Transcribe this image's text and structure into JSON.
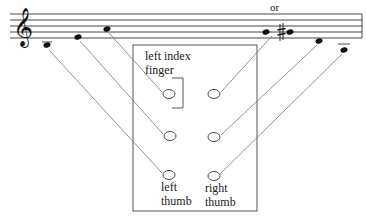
{
  "diagram": {
    "type": "fingering-diagram",
    "staff": {
      "clef": "treble-clef",
      "alt_label": "or",
      "notes": [
        {
          "id": "n1",
          "label": "low note below staff"
        },
        {
          "id": "n2",
          "label": "note below staff"
        },
        {
          "id": "n3",
          "label": "note on staff"
        },
        {
          "id": "n4",
          "label": "note (natural)"
        },
        {
          "id": "n5",
          "label": "note (sharp)"
        },
        {
          "id": "n6",
          "label": "note below staff"
        },
        {
          "id": "n7",
          "label": "note with ledger line"
        }
      ]
    },
    "hands": {
      "left_index_label_line1": "left index",
      "left_index_label_line2": "finger",
      "left_thumb_line1": "left",
      "left_thumb_line2": "thumb",
      "right_thumb_line1": "right",
      "right_thumb_line2": "thumb"
    },
    "holes": [
      {
        "id": "L1",
        "side": "left",
        "row": 1
      },
      {
        "id": "L2",
        "side": "left",
        "row": 2
      },
      {
        "id": "L3",
        "side": "left",
        "row": 3
      },
      {
        "id": "R1",
        "side": "right",
        "row": 1
      },
      {
        "id": "R2",
        "side": "right",
        "row": 2
      },
      {
        "id": "R3",
        "side": "right",
        "row": 3
      }
    ],
    "connections": [
      {
        "from": "n3",
        "to": "L1"
      },
      {
        "from": "n2",
        "to": "L2"
      },
      {
        "from": "n1",
        "to": "L3"
      },
      {
        "from": "n4/n5",
        "to": "R1"
      },
      {
        "from": "n6",
        "to": "R2"
      },
      {
        "from": "n7",
        "to": "R3"
      }
    ]
  }
}
